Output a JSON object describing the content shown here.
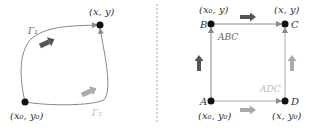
{
  "left_panel": {
    "start_label": "(x₀, y₀)",
    "end_label": "(x, y)",
    "path1_label": "Γ₁",
    "path2_label": "Γ₂"
  },
  "right_panel": {
    "points": {
      "A": {
        "name": "A",
        "coord": "(x₀, y₀)"
      },
      "B": {
        "name": "B",
        "coord": "(x₀, y)"
      },
      "C": {
        "name": "C",
        "coord": "(x, y)"
      },
      "D": {
        "name": "D",
        "coord": "(x, y₀)"
      }
    },
    "path_abc_label": "ABC",
    "path_adc_label": "ADC"
  },
  "colors": {
    "dark_arrow": "#555555",
    "light_arrow": "#aaaaaa",
    "line": "#888888",
    "point": "#111111"
  }
}
